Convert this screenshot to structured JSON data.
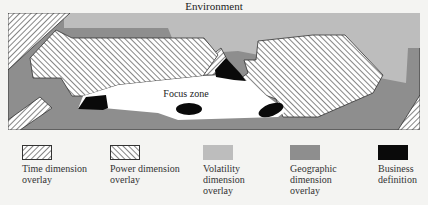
{
  "diagram": {
    "title": "Environment",
    "focus_label": "Focus zone",
    "colors": {
      "background": "#f4f4f2",
      "geographic": "#8e8e8e",
      "volatility": "#bdbdbd",
      "business": "#0a0a0a",
      "focus": "#ffffff",
      "hatch_line": "#444444"
    }
  },
  "legend": {
    "items": [
      {
        "id": "time",
        "label_line1": "Time dimension",
        "label_line2": "overlay",
        "label_line3": "",
        "pattern": "hatch-forward"
      },
      {
        "id": "power",
        "label_line1": "Power dimension",
        "label_line2": "overlay",
        "label_line3": "",
        "pattern": "hatch-back"
      },
      {
        "id": "volatility",
        "label_line1": "Volatility",
        "label_line2": "dimension",
        "label_line3": "overlay",
        "pattern": "light-gray"
      },
      {
        "id": "geographic",
        "label_line1": "Geographic",
        "label_line2": "dimension",
        "label_line3": "overlay",
        "pattern": "dark-gray"
      },
      {
        "id": "business",
        "label_line1": "Business",
        "label_line2": "definition",
        "label_line3": "",
        "pattern": "black"
      }
    ]
  }
}
